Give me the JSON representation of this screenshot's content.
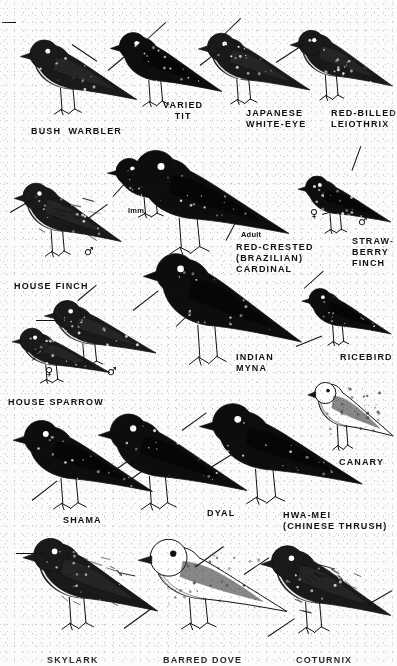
{
  "plate": {
    "kind": "bird-identification-plate",
    "style": "black-and-white halftone engraving",
    "width": 397,
    "height": 666,
    "background_color": "#fbfbf9",
    "ink_color": "#101010",
    "rows": 5,
    "total_birds": 16
  },
  "symbols": {
    "male": "♂",
    "female": "♀"
  },
  "labels": [
    {
      "id": "bush-warbler",
      "text": "BUSH  WARBLER",
      "x": 31,
      "y": 126,
      "align": "left",
      "lines": [
        "BUSH  WARBLER"
      ]
    },
    {
      "id": "varied-tit",
      "text": "VARIED\nTIT",
      "x": 163,
      "y": 100,
      "align": "center",
      "lines": [
        "VARIED",
        "TIT"
      ]
    },
    {
      "id": "japanese-white-eye",
      "text": "JAPANESE\nWHITE-EYE",
      "x": 246,
      "y": 108,
      "align": "left",
      "lines": [
        "JAPANESE",
        "WHITE-EYE"
      ]
    },
    {
      "id": "red-billed-leiothrix",
      "text": "RED-BILLED\nLEIOTHRIX",
      "x": 331,
      "y": 108,
      "align": "left",
      "lines": [
        "RED-BILLED",
        "LEIOTHRIX"
      ]
    },
    {
      "id": "house-finch",
      "text": "HOUSE FINCH",
      "x": 14,
      "y": 281,
      "align": "left",
      "lines": [
        "HOUSE FINCH"
      ]
    },
    {
      "id": "imm",
      "text": "Imm.",
      "x": 128,
      "y": 205,
      "align": "left",
      "lines": [
        "Imm."
      ],
      "small": true
    },
    {
      "id": "adult",
      "text": "Adult",
      "x": 241,
      "y": 229,
      "align": "left",
      "lines": [
        "Adult"
      ],
      "small": true
    },
    {
      "id": "red-crested-cardinal",
      "text": "RED-CRESTED\n(BRAZILIAN)\nCARDINAL",
      "x": 236,
      "y": 242,
      "align": "left",
      "lines": [
        "RED-CRESTED",
        "(BRAZILIAN)",
        "CARDINAL"
      ]
    },
    {
      "id": "strawberry-finch",
      "text": "STRAW-\nBERRY\nFINCH",
      "x": 352,
      "y": 236,
      "align": "left",
      "lines": [
        "STRAW-",
        "BERRY",
        "FINCH"
      ]
    },
    {
      "id": "house-sparrow",
      "text": "HOUSE SPARROW",
      "x": 8,
      "y": 397,
      "align": "left",
      "lines": [
        "HOUSE SPARROW"
      ]
    },
    {
      "id": "indian-myna",
      "text": "INDIAN\nMYNA",
      "x": 236,
      "y": 352,
      "align": "left",
      "lines": [
        "INDIAN",
        "MYNA"
      ]
    },
    {
      "id": "ricebird",
      "text": "RICEBIRD",
      "x": 340,
      "y": 352,
      "align": "left",
      "lines": [
        "RICEBIRD"
      ]
    },
    {
      "id": "shama",
      "text": "SHAMA",
      "x": 63,
      "y": 515,
      "align": "left",
      "lines": [
        "SHAMA"
      ]
    },
    {
      "id": "dyal",
      "text": "DYAL",
      "x": 207,
      "y": 508,
      "align": "left",
      "lines": [
        "DYAL"
      ]
    },
    {
      "id": "hwa-mei",
      "text": "HWA-MEI\n(CHINESE THRUSH)",
      "x": 283,
      "y": 510,
      "align": "left",
      "lines": [
        "HWA-MEI",
        "(CHINESE THRUSH)"
      ]
    },
    {
      "id": "canary",
      "text": "CANARY",
      "x": 339,
      "y": 457,
      "align": "left",
      "lines": [
        "CANARY"
      ]
    },
    {
      "id": "skylark",
      "text": "SKYLARK",
      "x": 47,
      "y": 655,
      "align": "left",
      "lines": [
        "SKYLARK"
      ]
    },
    {
      "id": "barred-dove",
      "text": "BARRED DOVE",
      "x": 163,
      "y": 655,
      "align": "left",
      "lines": [
        "BARRED DOVE"
      ]
    },
    {
      "id": "coturnix",
      "text": "COTURNIX",
      "x": 296,
      "y": 655,
      "align": "left",
      "lines": [
        "COTURNIX"
      ]
    }
  ],
  "sex_marks": [
    {
      "id": "house-finch-male",
      "symbol": "♂",
      "x": 84,
      "y": 246
    },
    {
      "id": "strawberry-finch-female",
      "symbol": "♀",
      "x": 310,
      "y": 208
    },
    {
      "id": "strawberry-finch-male",
      "symbol": "♂",
      "x": 358,
      "y": 216
    },
    {
      "id": "house-sparrow-female",
      "symbol": "♀",
      "x": 45,
      "y": 366
    },
    {
      "id": "house-sparrow-male",
      "symbol": "♂",
      "x": 107,
      "y": 366
    }
  ],
  "birds": [
    {
      "id": "bush-warbler",
      "label": "BUSH  WARBLER",
      "row": 1,
      "x": 18,
      "y": 26,
      "w": 125,
      "h": 105,
      "tone": "mixed"
    },
    {
      "id": "varied-tit",
      "label": "VARIED TIT",
      "row": 1,
      "x": 108,
      "y": 18,
      "w": 120,
      "h": 105,
      "tone": "dark"
    },
    {
      "id": "japanese-white-eye",
      "label": "JAPANESE WHITE-EYE",
      "row": 1,
      "x": 196,
      "y": 20,
      "w": 120,
      "h": 100,
      "tone": "mixed"
    },
    {
      "id": "red-billed-leiothrix",
      "label": "RED-BILLED LEIOTHRIX",
      "row": 1,
      "x": 288,
      "y": 16,
      "w": 110,
      "h": 100,
      "tone": "mixed"
    },
    {
      "id": "house-finch",
      "label": "HOUSE FINCH",
      "row": 2,
      "x": 12,
      "y": 168,
      "w": 115,
      "h": 105,
      "tone": "streaked"
    },
    {
      "id": "cardinal-imm",
      "label": "RED-CRESTED CARDINAL (Imm.)",
      "row": 2,
      "x": 105,
      "y": 150,
      "w": 115,
      "h": 80,
      "tone": "dark"
    },
    {
      "id": "cardinal-adult",
      "label": "RED-CRESTED (BRAZILIAN) CARDINAL",
      "row": 2,
      "x": 118,
      "y": 132,
      "w": 180,
      "h": 145,
      "tone": "dark"
    },
    {
      "id": "strawberry-finch",
      "label": "STRAWBERRY FINCH",
      "row": 2,
      "x": 296,
      "y": 166,
      "w": 100,
      "h": 80,
      "tone": "dark"
    },
    {
      "id": "house-sparrow-f",
      "label": "HOUSE SPARROW ♀",
      "row": 3,
      "x": 10,
      "y": 320,
      "w": 105,
      "h": 75,
      "tone": "mixed"
    },
    {
      "id": "house-sparrow-m",
      "label": "HOUSE SPARROW ♂",
      "row": 3,
      "x": 42,
      "y": 290,
      "w": 120,
      "h": 90,
      "tone": "mixed"
    },
    {
      "id": "indian-myna",
      "label": "INDIAN MYNA",
      "row": 3,
      "x": 140,
      "y": 230,
      "w": 170,
      "h": 160,
      "tone": "dark"
    },
    {
      "id": "ricebird",
      "label": "RICEBIRD",
      "row": 3,
      "x": 300,
      "y": 278,
      "w": 96,
      "h": 80,
      "tone": "dark"
    },
    {
      "id": "shama",
      "label": "SHAMA",
      "row": 4,
      "x": 10,
      "y": 404,
      "w": 150,
      "h": 125,
      "tone": "dark"
    },
    {
      "id": "dyal",
      "label": "DYAL",
      "row": 4,
      "x": 95,
      "y": 396,
      "w": 160,
      "h": 135,
      "tone": "dark"
    },
    {
      "id": "hwa-mei",
      "label": "HWA-MEI (CHINESE THRUSH)",
      "row": 4,
      "x": 196,
      "y": 386,
      "w": 175,
      "h": 140,
      "tone": "dark"
    },
    {
      "id": "canary",
      "label": "CANARY",
      "row": 4,
      "x": 306,
      "y": 366,
      "w": 92,
      "h": 100,
      "tone": "light"
    },
    {
      "id": "skylark",
      "label": "SKYLARK",
      "row": 5,
      "x": 20,
      "y": 520,
      "w": 145,
      "h": 130,
      "tone": "streaked"
    },
    {
      "id": "barred-dove",
      "label": "BARRED DOVE",
      "row": 5,
      "x": 135,
      "y": 524,
      "w": 160,
      "h": 125,
      "tone": "light"
    },
    {
      "id": "coturnix",
      "label": "COTURNIX",
      "row": 5,
      "x": 258,
      "y": 528,
      "w": 140,
      "h": 125,
      "tone": "streaked"
    }
  ],
  "leaders": [
    {
      "id": "leader-bush-warbler",
      "x": 72,
      "y": 44,
      "len": 30,
      "angle": 34
    },
    {
      "id": "leader-bush-warbler-2",
      "x": 2,
      "y": 22,
      "len": 14,
      "angle": 0
    },
    {
      "id": "leader-varied-tit",
      "x": 108,
      "y": 70,
      "len": 42,
      "angle": -40
    },
    {
      "id": "leader-varied-tit-2",
      "x": 148,
      "y": 38,
      "len": 24,
      "angle": -42
    },
    {
      "id": "leader-white-eye",
      "x": 200,
      "y": 65,
      "len": 33,
      "angle": -38
    },
    {
      "id": "leader-white-eye-2",
      "x": 222,
      "y": 36,
      "len": 26,
      "angle": -44
    },
    {
      "id": "leader-leiothrix",
      "x": 276,
      "y": 62,
      "len": 34,
      "angle": -33
    },
    {
      "id": "leader-house-finch",
      "x": 10,
      "y": 212,
      "len": 26,
      "angle": -30
    },
    {
      "id": "leader-house-finch-2",
      "x": 88,
      "y": 218,
      "len": 24,
      "angle": -36
    },
    {
      "id": "leader-imm",
      "x": 113,
      "y": 196,
      "len": 26,
      "angle": -48
    },
    {
      "id": "leader-cardinal",
      "x": 133,
      "y": 310,
      "len": 32,
      "angle": -38
    },
    {
      "id": "leader-cardinal-2",
      "x": 226,
      "y": 240,
      "len": 20,
      "angle": -62
    },
    {
      "id": "leader-strawberry",
      "x": 352,
      "y": 170,
      "len": 26,
      "angle": -70
    },
    {
      "id": "leader-strawberry-2",
      "x": 322,
      "y": 214,
      "len": 24,
      "angle": -16
    },
    {
      "id": "leader-sparrow",
      "x": 32,
      "y": 360,
      "len": 26,
      "angle": -42
    },
    {
      "id": "leader-sparrow-2",
      "x": 36,
      "y": 320,
      "len": 28,
      "angle": 0
    },
    {
      "id": "leader-sparrow-3",
      "x": 78,
      "y": 300,
      "len": 24,
      "angle": -40
    },
    {
      "id": "leader-myna",
      "x": 176,
      "y": 326,
      "len": 26,
      "angle": -44
    },
    {
      "id": "leader-myna-2",
      "x": 296,
      "y": 346,
      "len": 28,
      "angle": -22
    },
    {
      "id": "leader-ricebird",
      "x": 304,
      "y": 288,
      "len": 26,
      "angle": -42
    },
    {
      "id": "leader-shama",
      "x": 32,
      "y": 500,
      "len": 32,
      "angle": -38
    },
    {
      "id": "leader-shama-2",
      "x": 112,
      "y": 472,
      "len": 34,
      "angle": -36
    },
    {
      "id": "leader-dyal",
      "x": 132,
      "y": 478,
      "len": 34,
      "angle": -36
    },
    {
      "id": "leader-dyal-2",
      "x": 182,
      "y": 430,
      "len": 30,
      "angle": -36
    },
    {
      "id": "leader-hwa-mei",
      "x": 206,
      "y": 470,
      "len": 34,
      "angle": -32
    },
    {
      "id": "leader-skylark",
      "x": 16,
      "y": 553,
      "len": 30,
      "angle": 0
    },
    {
      "id": "leader-skylark-2",
      "x": 124,
      "y": 628,
      "len": 34,
      "angle": -36
    },
    {
      "id": "leader-barred-dove",
      "x": 196,
      "y": 566,
      "len": 34,
      "angle": -36
    },
    {
      "id": "leader-barred-dove-2",
      "x": 268,
      "y": 636,
      "len": 32,
      "angle": -34
    },
    {
      "id": "leader-coturnix",
      "x": 244,
      "y": 574,
      "len": 30,
      "angle": -34
    },
    {
      "id": "leader-coturnix-2",
      "x": 368,
      "y": 604,
      "len": 28,
      "angle": -30
    }
  ]
}
